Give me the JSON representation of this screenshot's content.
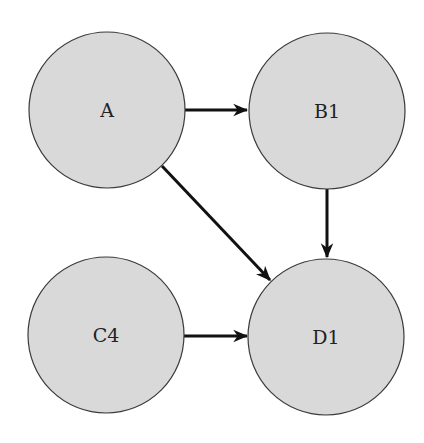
{
  "diagram": {
    "type": "directed-graph",
    "style": {
      "node_fill": "#d9d9d9",
      "node_stroke": "#3a3a3a",
      "edge_color": "#111111",
      "background": "#ffffff"
    },
    "nodes": [
      {
        "id": "A",
        "label": "A",
        "cx": 107,
        "cy": 110,
        "r": 78
      },
      {
        "id": "B1",
        "label": "B1",
        "cx": 327,
        "cy": 111,
        "r": 78
      },
      {
        "id": "C4",
        "label": "C4",
        "cx": 106,
        "cy": 335,
        "r": 78
      },
      {
        "id": "D1",
        "label": "D1",
        "cx": 326,
        "cy": 337,
        "r": 78
      }
    ],
    "edges": [
      {
        "from": "A",
        "to": "B1",
        "x1": 185,
        "y1": 110,
        "x2": 247,
        "y2": 110
      },
      {
        "from": "A",
        "to": "D1",
        "x1": 162,
        "y1": 166,
        "x2": 270,
        "y2": 280
      },
      {
        "from": "B1",
        "to": "D1",
        "x1": 327,
        "y1": 189,
        "x2": 327,
        "y2": 257
      },
      {
        "from": "C4",
        "to": "D1",
        "x1": 184,
        "y1": 336,
        "x2": 247,
        "y2": 336
      }
    ]
  }
}
